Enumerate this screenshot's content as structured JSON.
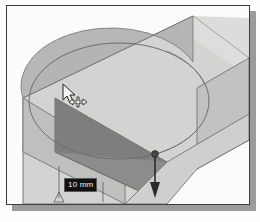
{
  "figure": {
    "kind": "cad-viewport-screenshot",
    "background_color": "#fbfbfa",
    "frame_color": "#3c3c3c",
    "shadow_color": "#9b9b99"
  },
  "viewport": {
    "name": "3d-modeling-viewport"
  },
  "dimension": {
    "label": "10 mm",
    "value": 10,
    "unit": "mm",
    "text_color": "#f2f2f2",
    "background_color": "#111111"
  },
  "extrude_arrow": {
    "name": "extrude-direction-arrow",
    "direction": "down",
    "handle": "drag-handle-dot"
  },
  "cursor": {
    "name": "arrow-cursor",
    "badge": "move-cross-badge"
  },
  "geometry": {
    "circle_sketch": {
      "name": "circle-sketch-ellipse",
      "fill": "#c9c9c9",
      "stroke": "#6f6f6f"
    },
    "slab": {
      "name": "extruded-slab",
      "top_face_color": "#d4d4d2",
      "front_face_color": "#8e8e8e",
      "side_face_color": "#bdbdbb",
      "edge_color": "#6a6a6a"
    }
  }
}
